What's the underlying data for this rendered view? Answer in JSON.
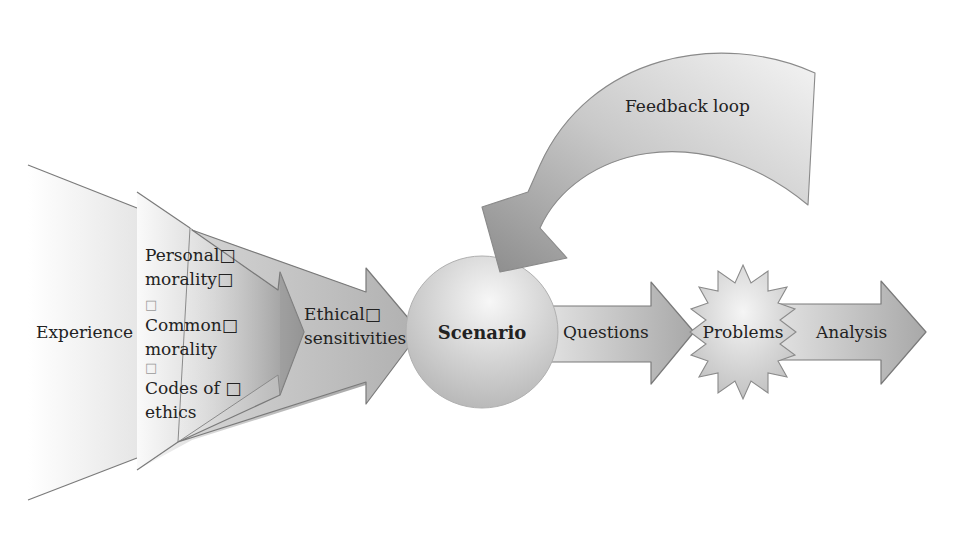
{
  "diagram": {
    "type": "process-flow",
    "nodes": {
      "experience": {
        "label": "Experience",
        "shape": "funnel"
      },
      "inputs": {
        "shape": "converging-arrows",
        "lines": [
          "Personal□",
          "morality□",
          "□",
          "Common□",
          "morality",
          "□",
          "Codes of □",
          "ethics"
        ]
      },
      "ethical": {
        "line1": "Ethical□",
        "line2": "sensitivities",
        "shape": "arrow"
      },
      "scenario": {
        "label": "Scenario",
        "shape": "sphere"
      },
      "questions": {
        "label": "Questions",
        "shape": "arrow"
      },
      "problems": {
        "label": "Problems",
        "shape": "starburst"
      },
      "analysis": {
        "label": "Analysis",
        "shape": "arrow"
      },
      "feedback": {
        "label": "Feedback loop",
        "shape": "curved-arrow"
      }
    },
    "edges": [
      [
        "Experience",
        "Inputs"
      ],
      [
        "Inputs",
        "Ethical sensitivities"
      ],
      [
        "Ethical sensitivities",
        "Scenario"
      ],
      [
        "Scenario",
        "Questions"
      ],
      [
        "Questions",
        "Problems"
      ],
      [
        "Problems",
        "Analysis"
      ],
      [
        "Feedback loop",
        "Scenario"
      ]
    ],
    "colors": {
      "background": "#ffffff",
      "shape_light": "#f2f2f2",
      "shape_mid": "#c8c8c8",
      "shape_dark": "#8a8a8a",
      "stroke": "#7a7a7a",
      "text": "#222222"
    }
  }
}
